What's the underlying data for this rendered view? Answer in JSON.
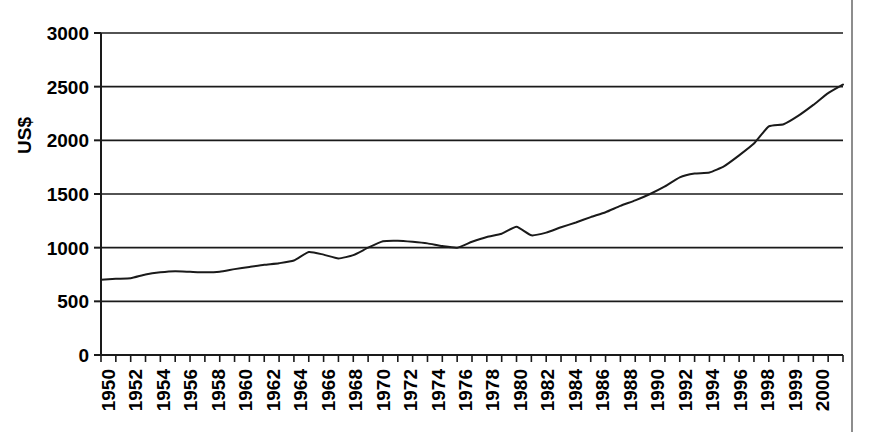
{
  "chart_data": {
    "type": "line",
    "title": "",
    "xlabel": "",
    "ylabel": "US$",
    "ylim": [
      0,
      3000
    ],
    "yticks": [
      0,
      500,
      1000,
      1500,
      2000,
      2500,
      3000
    ],
    "ytick_labels": [
      "0",
      "500",
      "1000",
      "1500",
      "2000",
      "2500",
      "3000"
    ],
    "grid": true,
    "grid_axis": "y",
    "legend": false,
    "xlim": [
      1950,
      2000
    ],
    "xtick_labels": [
      "1950",
      "1952",
      "1954",
      "1956",
      "1958",
      "1960",
      "1962",
      "1964",
      "1966",
      "1968",
      "1970",
      "1972",
      "1974",
      "1976",
      "1978",
      "1980",
      "1982",
      "1984",
      "1986",
      "1988",
      "1990",
      "1992",
      "1994",
      "1996",
      "1998",
      "1999",
      "2000"
    ],
    "xtick_label_rotation": -90,
    "x": [
      1950,
      1951,
      1952,
      1953,
      1954,
      1955,
      1956,
      1957,
      1958,
      1959,
      1960,
      1961,
      1962,
      1963,
      1964,
      1965,
      1966,
      1967,
      1968,
      1969,
      1970,
      1971,
      1972,
      1973,
      1974,
      1975,
      1976,
      1977,
      1978,
      1979,
      1980,
      1981,
      1982,
      1983,
      1984,
      1985,
      1986,
      1987,
      1988,
      1989,
      1990,
      1991,
      1992,
      1993,
      1994,
      1995,
      1996,
      1997,
      1998,
      1999,
      2000
    ],
    "values": [
      700,
      710,
      715,
      750,
      770,
      780,
      775,
      770,
      775,
      800,
      820,
      840,
      855,
      880,
      960,
      935,
      900,
      930,
      1000,
      1060,
      1065,
      1055,
      1040,
      1015,
      1000,
      1055,
      1100,
      1130,
      1195,
      1115,
      1140,
      1190,
      1235,
      1285,
      1330,
      1390,
      1440,
      1500,
      1570,
      1655,
      1690,
      1700,
      1760,
      1860,
      1970,
      2130,
      2150,
      2230,
      2330,
      2440,
      2520
    ],
    "series_name": "",
    "line_color": "#1a1a1a",
    "line_width": 2
  },
  "page": {
    "background_color": "#ffffff",
    "border_color": "#8d8d8d"
  }
}
